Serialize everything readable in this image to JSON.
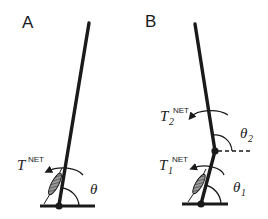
{
  "panels": {
    "a": {
      "label": "A",
      "torque": {
        "symbol": "T",
        "superscript": "NET",
        "subscript": ""
      },
      "angle": {
        "symbol": "θ",
        "subscript": ""
      }
    },
    "b": {
      "label": "B",
      "torque_upper": {
        "symbol": "T",
        "superscript": "NET",
        "subscript": "2"
      },
      "angle_upper": {
        "symbol": "θ",
        "subscript": "2"
      },
      "torque_lower": {
        "symbol": "T",
        "superscript": "NET",
        "subscript": "1"
      },
      "angle_lower": {
        "symbol": "θ",
        "subscript": "1"
      }
    }
  },
  "colors": {
    "ink": "#1a1a1a",
    "muscle_fill": "#7a7a7a"
  }
}
